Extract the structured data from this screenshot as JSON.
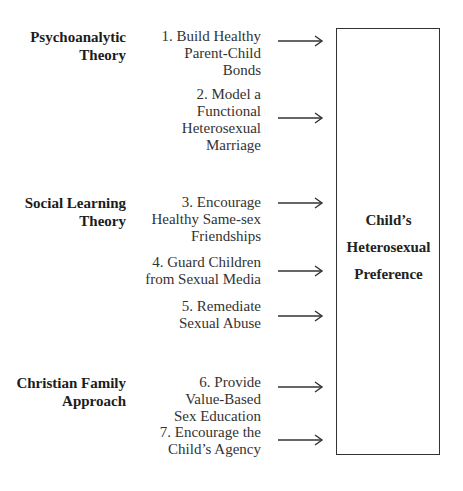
{
  "categories": [
    {
      "lines": [
        "Psychoanalytic",
        "Theory"
      ]
    },
    {
      "lines": [
        "Social Learning",
        "Theory"
      ]
    },
    {
      "lines": [
        "Christian Family",
        "Approach"
      ]
    }
  ],
  "items": [
    {
      "category": "Psychoanalytic Theory",
      "lines": [
        "1. Build Healthy",
        "Parent-Child",
        "Bonds"
      ]
    },
    {
      "category": "Psychoanalytic Theory",
      "lines": [
        "2. Model a",
        "Functional",
        "Heterosexual",
        "Marriage"
      ]
    },
    {
      "category": "Social Learning Theory",
      "lines": [
        "3. Encourage",
        "Healthy Same-sex",
        "Friendships"
      ]
    },
    {
      "category": "Social Learning Theory",
      "lines": [
        "4. Guard Children",
        "from Sexual Media"
      ]
    },
    {
      "category": "Social Learning Theory",
      "lines": [
        "5. Remediate",
        "Sexual Abuse"
      ]
    },
    {
      "category": "Christian Family Approach",
      "lines": [
        "6. Provide",
        "Value-Based",
        "Sex Education"
      ]
    },
    {
      "category": "Christian Family Approach",
      "lines": [
        "7. Encourage the",
        "Child’s Agency"
      ]
    }
  ],
  "outcome": {
    "lines": [
      "Child’s",
      "Heterosexual",
      "Preference"
    ]
  },
  "arrow_icon": "right-arrow-icon",
  "colors": {
    "line": "#333333",
    "text": "#2a2a2a",
    "background": "#ffffff"
  }
}
